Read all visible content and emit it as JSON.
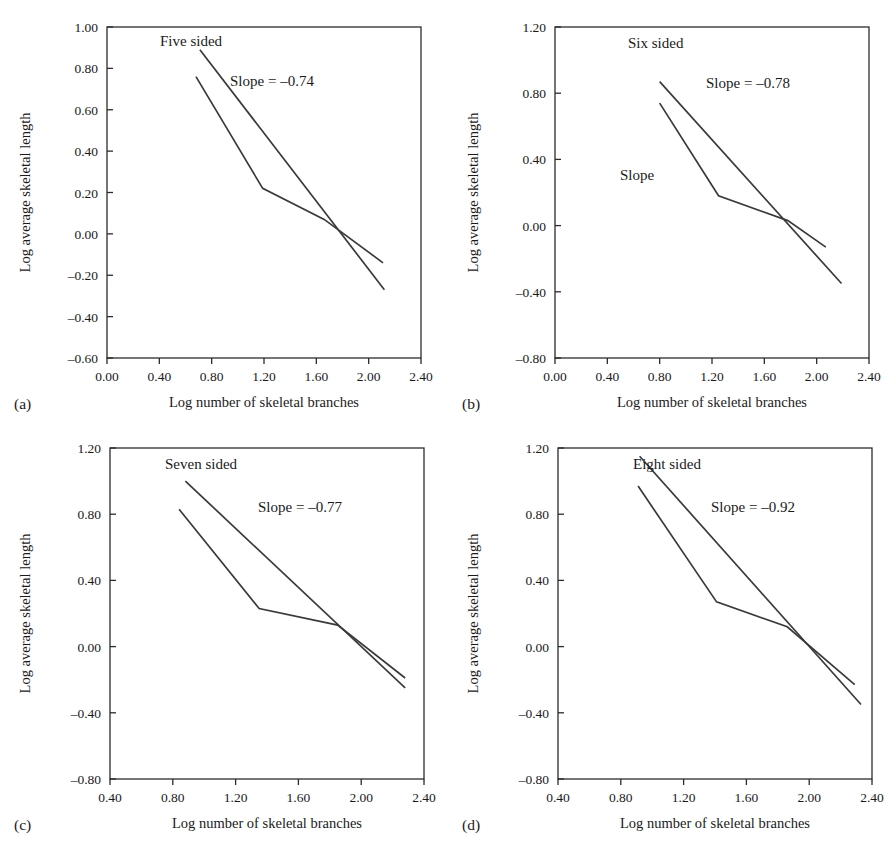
{
  "figure": {
    "background": "#ffffff",
    "line_color": "#3a3a3a",
    "axis_color": "#2b2b2b",
    "shared_xlabel": "Log number of skeletal branches",
    "shared_ylabel": "Log average skeletal length"
  },
  "chart_data": [
    {
      "type": "line",
      "panel": "a",
      "panel_letter": "(a)",
      "title": "Five sided",
      "annotation": "Slope = –0.74",
      "slope": -0.74,
      "extra_label": "",
      "xlabel": "Log number of skeletal branches",
      "ylabel": "Log average skeletal length",
      "xlim": [
        0.0,
        2.4
      ],
      "ylim": [
        -0.6,
        1.0
      ],
      "xticks": [
        "0.00",
        "0.40",
        "0.80",
        "1.20",
        "1.60",
        "2.00",
        "2.40"
      ],
      "xtick_values": [
        0.0,
        0.4,
        0.8,
        1.2,
        1.6,
        2.0,
        2.4
      ],
      "yticks": [
        "1.00",
        "0.80",
        "0.60",
        "0.40",
        "0.20",
        "0.00",
        "-0.20",
        "-0.40",
        "-0.60"
      ],
      "ytick_values": [
        1.0,
        0.8,
        0.6,
        0.4,
        0.2,
        0.0,
        -0.2,
        -0.4,
        -0.6
      ],
      "grid": false,
      "legend": "none",
      "series": [
        {
          "name": "data",
          "kind": "piecewise",
          "x": [
            0.68,
            1.19,
            1.66,
            2.11
          ],
          "y": [
            0.76,
            0.22,
            0.07,
            -0.14
          ]
        },
        {
          "name": "fit",
          "kind": "straight",
          "x": [
            0.71,
            2.12
          ],
          "y": [
            0.89,
            -0.27
          ]
        }
      ]
    },
    {
      "type": "line",
      "panel": "b",
      "panel_letter": "(b)",
      "title": "Six sided",
      "annotation": "Slope = –0.78",
      "slope": -0.78,
      "extra_label": "Slope",
      "xlabel": "Log number of skeletal branches",
      "ylabel": "Log average skeletal length",
      "xlim": [
        0.0,
        2.4
      ],
      "ylim": [
        -0.8,
        1.2
      ],
      "xticks": [
        "0.00",
        "0.40",
        "0.80",
        "1.20",
        "1.60",
        "2.00",
        "2.40"
      ],
      "xtick_values": [
        0.0,
        0.4,
        0.8,
        1.2,
        1.6,
        2.0,
        2.4
      ],
      "yticks": [
        "1.20",
        "0.80",
        "0.40",
        "0.00",
        "-0.40",
        "-0.80"
      ],
      "ytick_values": [
        1.2,
        0.8,
        0.4,
        0.0,
        -0.4,
        -0.8
      ],
      "grid": false,
      "legend": "none",
      "series": [
        {
          "name": "data",
          "kind": "piecewise",
          "x": [
            0.8,
            1.25,
            1.78,
            2.07
          ],
          "y": [
            0.74,
            0.18,
            0.03,
            -0.13
          ]
        },
        {
          "name": "fit",
          "kind": "straight",
          "x": [
            0.8,
            2.19
          ],
          "y": [
            0.87,
            -0.35
          ]
        }
      ]
    },
    {
      "type": "line",
      "panel": "c",
      "panel_letter": "(c)",
      "title": "Seven sided",
      "annotation": "Slope = –0.77",
      "slope": -0.77,
      "extra_label": "",
      "xlabel": "Log number of skeletal branches",
      "ylabel": "Log average skeletal length",
      "xlim": [
        0.4,
        2.4
      ],
      "ylim": [
        -0.8,
        1.2
      ],
      "xticks": [
        "0.40",
        "0.80",
        "1.20",
        "1.60",
        "2.00",
        "2.40"
      ],
      "xtick_values": [
        0.4,
        0.8,
        1.2,
        1.6,
        2.0,
        2.4
      ],
      "yticks": [
        "1.20",
        "0.80",
        "0.40",
        "0.00",
        "-0.40",
        "-0.80"
      ],
      "ytick_values": [
        1.2,
        0.8,
        0.4,
        0.0,
        -0.4,
        -0.8
      ],
      "grid": false,
      "legend": "none",
      "series": [
        {
          "name": "data",
          "kind": "piecewise",
          "x": [
            0.84,
            1.35,
            1.85,
            2.28
          ],
          "y": [
            0.83,
            0.23,
            0.13,
            -0.19
          ]
        },
        {
          "name": "fit",
          "kind": "straight",
          "x": [
            0.88,
            2.28
          ],
          "y": [
            1.0,
            -0.25
          ]
        }
      ]
    },
    {
      "type": "line",
      "panel": "d",
      "panel_letter": "(d)",
      "title": "Eight sided",
      "annotation": "Slope = –0.92",
      "slope": -0.92,
      "extra_label": "",
      "xlabel": "Log number of skeletal branches",
      "ylabel": "Log average skeletal length",
      "xlim": [
        0.4,
        2.4
      ],
      "ylim": [
        -0.8,
        1.2
      ],
      "xticks": [
        "0.40",
        "0.80",
        "1.20",
        "1.60",
        "2.00",
        "2.40"
      ],
      "xtick_values": [
        0.4,
        0.8,
        1.2,
        1.6,
        2.0,
        2.4
      ],
      "yticks": [
        "1.20",
        "0.80",
        "0.40",
        "0.00",
        "-0.40",
        "-0.80"
      ],
      "ytick_values": [
        1.2,
        0.8,
        0.4,
        0.0,
        -0.4,
        -0.8
      ],
      "grid": false,
      "legend": "none",
      "series": [
        {
          "name": "data",
          "kind": "piecewise",
          "x": [
            0.91,
            1.41,
            1.86,
            2.29
          ],
          "y": [
            0.97,
            0.27,
            0.12,
            -0.23
          ]
        },
        {
          "name": "fit",
          "kind": "straight",
          "x": [
            0.92,
            2.33
          ],
          "y": [
            1.15,
            -0.35
          ]
        }
      ]
    }
  ],
  "layout": {
    "panels": [
      {
        "id": "a",
        "left": 0,
        "top": 0
      },
      {
        "id": "b",
        "left": 448,
        "top": 0
      },
      {
        "id": "c",
        "left": 0,
        "top": 424
      },
      {
        "id": "d",
        "left": 448,
        "top": 424
      }
    ]
  }
}
